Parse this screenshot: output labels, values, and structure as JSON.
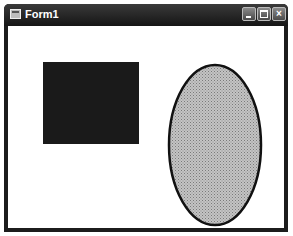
{
  "window": {
    "title": "Form1",
    "controls": {
      "minimize": "minimize",
      "maximize": "maximize",
      "close": "×"
    }
  },
  "canvas": {
    "rectangle": {
      "fill": "#1a1a1a"
    },
    "ellipse": {
      "fill": "#b8b8b8",
      "stroke": "#111111",
      "pattern": "dotted-hatch"
    }
  }
}
